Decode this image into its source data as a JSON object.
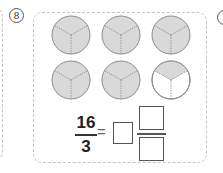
{
  "question": {
    "number": "8",
    "fraction": {
      "numerator": "16",
      "denominator": "3"
    },
    "equals_sign": "=",
    "answer_boxes": {
      "whole": "",
      "numerator": "",
      "denominator": ""
    }
  },
  "figure": {
    "circles": [
      {
        "row": 1,
        "col": 1,
        "parts": 3,
        "shaded": 3
      },
      {
        "row": 1,
        "col": 2,
        "parts": 3,
        "shaded": 3
      },
      {
        "row": 1,
        "col": 3,
        "parts": 3,
        "shaded": 3
      },
      {
        "row": 2,
        "col": 1,
        "parts": 3,
        "shaded": 3
      },
      {
        "row": 2,
        "col": 2,
        "parts": 3,
        "shaded": 3
      },
      {
        "row": 2,
        "col": 3,
        "parts": 3,
        "shaded": 1
      }
    ],
    "colors": {
      "shaded": "#d9d9d9",
      "outline": "#8a8a8a",
      "divider": "#9a9a9a"
    }
  }
}
